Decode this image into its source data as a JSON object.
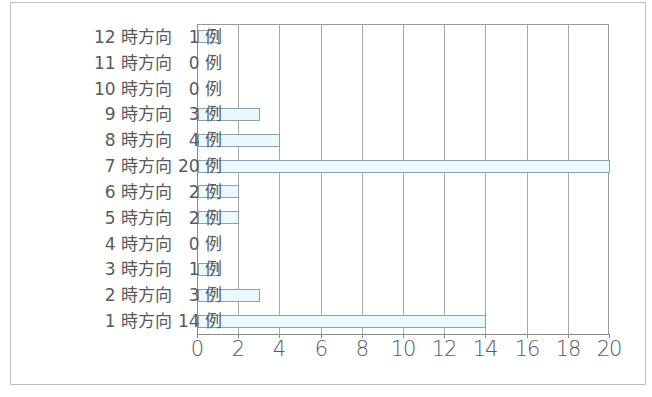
{
  "chart_data": {
    "type": "bar",
    "orientation": "horizontal",
    "title": "",
    "xlabel": "",
    "ylabel": "",
    "categories": [
      "12時方向",
      "11時方向",
      "10時方向",
      "9時方向",
      "8時方向",
      "7時方向",
      "6時方向",
      "5時方向",
      "4時方向",
      "3時方向",
      "2時方向",
      "1時方向"
    ],
    "values": [
      1,
      0,
      0,
      3,
      4,
      20,
      2,
      2,
      0,
      1,
      3,
      14
    ],
    "count_labels": [
      "1 例",
      "0 例",
      "0 例",
      "3 例",
      "4 例",
      "20 例",
      "2 例",
      "2 例",
      "0 例",
      "1 例",
      "3 例",
      "14 例"
    ],
    "xlim": [
      0,
      20
    ],
    "xticks": [
      0,
      2,
      4,
      6,
      8,
      10,
      12,
      14,
      16,
      18,
      20
    ],
    "grid": "vertical",
    "legend": "none",
    "bar_fill": "#e8fafd",
    "bar_edge": "#8aa2a6"
  },
  "rows": [
    {
      "dir": "12 時方向",
      "cnt": "1 例"
    },
    {
      "dir": "11 時方向",
      "cnt": "0 例"
    },
    {
      "dir": "10 時方向",
      "cnt": "0 例"
    },
    {
      "dir": "9 時方向",
      "cnt": "3 例"
    },
    {
      "dir": "8 時方向",
      "cnt": "4 例"
    },
    {
      "dir": "7 時方向",
      "cnt": "20 例"
    },
    {
      "dir": "6 時方向",
      "cnt": "2 例"
    },
    {
      "dir": "5 時方向",
      "cnt": "2 例"
    },
    {
      "dir": "4 時方向",
      "cnt": "0 例"
    },
    {
      "dir": "3 時方向",
      "cnt": "1 例"
    },
    {
      "dir": "2 時方向",
      "cnt": "3 例"
    },
    {
      "dir": "1 時方向",
      "cnt": "14 例"
    }
  ],
  "xaxis": {
    "ticks": [
      "0",
      "2",
      "4",
      "6",
      "8",
      "10",
      "12",
      "14",
      "16",
      "18",
      "20"
    ]
  }
}
